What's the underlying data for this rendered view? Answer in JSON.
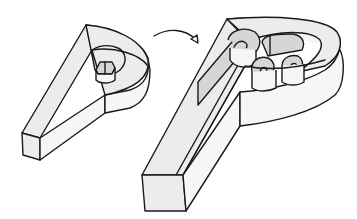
{
  "illustration": {
    "description": "Line drawing: a small hollow 3D letter P outline on the left, a curved arrow, and a larger hollow 3D letter P on the right filled with rolled paper spirals (quilling).",
    "colors": {
      "stroke": "#1a1a1a",
      "light_fill": "#ececec",
      "white_fill": "#f6f6f6",
      "shade_fill": "#d6d6d6",
      "background": "#ffffff"
    },
    "elements": [
      {
        "id": "small-letter-p",
        "label": "Empty 3D letter P outline"
      },
      {
        "id": "arrow",
        "label": "Curved arrow pointing right"
      },
      {
        "id": "large-letter-p",
        "label": "3D letter P filled with paper coils"
      }
    ]
  }
}
